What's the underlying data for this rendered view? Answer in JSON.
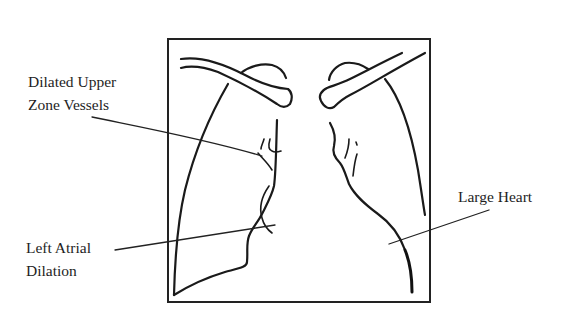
{
  "figure": {
    "type": "chest-xray-line-drawing",
    "labels": {
      "upper_zone": {
        "line1": "Dilated Upper",
        "line2": "Zone Vessels"
      },
      "left_atrial": {
        "line1": "Left Atrial",
        "line2": "Dilation"
      },
      "large_heart": {
        "line1": "Large Heart"
      }
    },
    "colors": {
      "ink": "#1a1a1a",
      "background": "#ffffff"
    }
  }
}
